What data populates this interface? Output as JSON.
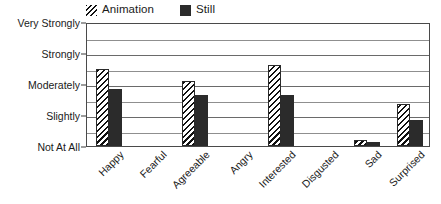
{
  "chart_data": {
    "type": "bar",
    "title": "",
    "subtitle": "",
    "xlabel": "",
    "ylabel": "",
    "categories": [
      "Happy",
      "Fearful",
      "Agreeable",
      "Angry",
      "Interested",
      "Disgusted",
      "Sad",
      "Surprised"
    ],
    "series": [
      {
        "name": "Animation",
        "color": "#ffffff",
        "pattern": "diagonal-hatch",
        "values": [
          2.5,
          0.0,
          2.1,
          0.0,
          2.6,
          0.0,
          0.2,
          1.35
        ]
      },
      {
        "name": "Still",
        "color": "#2b2b2b",
        "pattern": "solid",
        "values": [
          1.85,
          0.0,
          1.65,
          0.0,
          1.65,
          0.0,
          0.12,
          0.85
        ]
      }
    ],
    "ylim": [
      0,
      4
    ],
    "ytick_values": [
      0,
      1,
      2,
      3,
      4
    ],
    "ytick_labels": [
      "Not At All",
      "Slightly",
      "Moderately",
      "Strongly",
      "Very Strongly"
    ],
    "minor_gridlines": true,
    "minor_tick_step": 0.5,
    "grid": true,
    "legend_position": "top-left",
    "xtick_rotation": -45
  },
  "legend": {
    "entries": [
      {
        "label": "Animation",
        "swatch": "hatch-swatch-icon"
      },
      {
        "label": "Still",
        "swatch": "solid-swatch-icon"
      }
    ]
  },
  "colors": {
    "series_still": "#2b2b2b",
    "hatch_line": "#111111",
    "grid": "#8f8f8f",
    "axis": "#4a4a4a",
    "text": "#1a1a1a",
    "background": "#ffffff"
  }
}
